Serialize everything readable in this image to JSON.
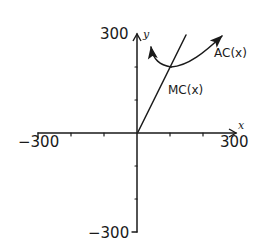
{
  "diagram": {
    "axes": {
      "x_name": "x",
      "y_name": "y",
      "x_min_label": "−300",
      "x_max_label": "300",
      "y_max_label": "300",
      "y_min_label": "−300",
      "x_range": [
        -300,
        300
      ],
      "y_range": [
        -300,
        300
      ],
      "tick_spacing": 100
    },
    "curves": [
      {
        "name": "MC",
        "label": "MC(x)",
        "shape": "straight line through origin, rising"
      },
      {
        "name": "AC",
        "label": "AC(x)",
        "shape": "U-shaped curve with arrows at both ends, minimum where it crosses MC"
      }
    ],
    "colors": {
      "ink": "#1a1a1a",
      "background": "#ffffff"
    }
  }
}
